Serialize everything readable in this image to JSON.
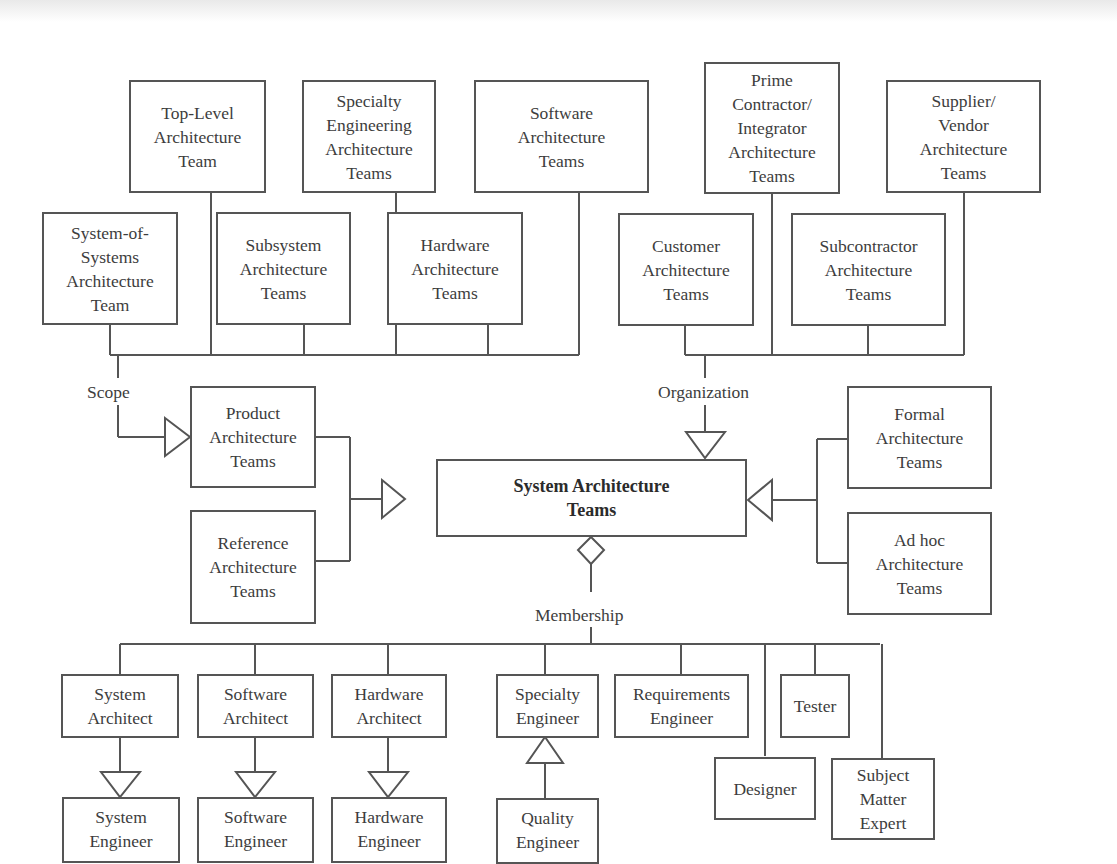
{
  "diagram": {
    "center": {
      "label": "System Architecture\nTeams"
    },
    "groups": {
      "scope": {
        "label": "Scope",
        "members": [
          {
            "label": "Top-Level\nArchitecture\nTeam"
          },
          {
            "label": "Specialty\nEngineering\nArchitecture\nTeams"
          },
          {
            "label": "Software\nArchitecture\nTeams"
          },
          {
            "label": "System-of-\nSystems\nArchitecture\nTeam"
          },
          {
            "label": "Subsystem\nArchitecture\nTeams"
          },
          {
            "label": "Hardware\nArchitecture\nTeams"
          }
        ]
      },
      "organization": {
        "label": "Organization",
        "members": [
          {
            "label": "Prime\nContractor/\nIntegrator\nArchitecture\nTeams"
          },
          {
            "label": "Supplier/\nVendor\nArchitecture\nTeams"
          },
          {
            "label": "Customer\nArchitecture\nTeams"
          },
          {
            "label": "Subcontractor\nArchitecture\nTeams"
          }
        ]
      },
      "product": {
        "members": [
          {
            "label": "Product\nArchitecture\nTeams"
          },
          {
            "label": "Reference\nArchitecture\nTeams"
          }
        ]
      },
      "formality": {
        "members": [
          {
            "label": "Formal\nArchitecture\nTeams"
          },
          {
            "label": "Ad hoc\nArchitecture\nTeams"
          }
        ]
      },
      "membership": {
        "label": "Membership",
        "members": [
          {
            "label": "System\nArchitect"
          },
          {
            "label": "Software\nArchitect"
          },
          {
            "label": "Hardware\nArchitect"
          },
          {
            "label": "Specialty\nEngineer"
          },
          {
            "label": "Requirements\nEngineer"
          },
          {
            "label": "Tester"
          },
          {
            "label": "Designer"
          },
          {
            "label": "Subject\nMatter\nExpert"
          }
        ],
        "specializations": [
          {
            "label": "System\nEngineer"
          },
          {
            "label": "Software\nEngineer"
          },
          {
            "label": "Hardware\nEngineer"
          },
          {
            "label": "Quality\nEngineer"
          }
        ]
      }
    },
    "colors": {
      "line": "#555555",
      "text": "#3d3d3d",
      "background": "#ffffff"
    }
  }
}
